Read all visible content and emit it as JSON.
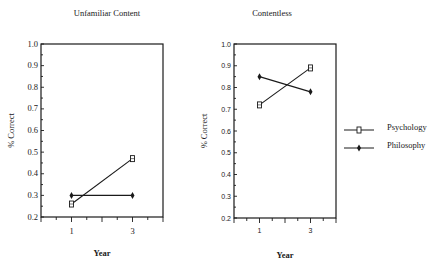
{
  "legend": {
    "items": [
      {
        "label": "Psychology",
        "marker": "open-square"
      },
      {
        "label": "Philosophy",
        "marker": "filled-diamond"
      }
    ]
  },
  "chart_data": [
    {
      "type": "line",
      "title": "Unfamiliar Content",
      "xlabel": "Year",
      "ylabel": "% Correct",
      "x": [
        1,
        3
      ],
      "x_tick_labels": [
        "1",
        "3"
      ],
      "y_tick_labels": [
        "0.2",
        "0.3",
        "0.4",
        "0.5",
        "0.6",
        "0.7",
        "0.8",
        "0.9",
        "1.0"
      ],
      "ylim": [
        0.2,
        1.0
      ],
      "xlim": [
        0,
        4
      ],
      "grid": false,
      "legend_position": "right",
      "series": [
        {
          "name": "Psychology",
          "values": [
            0.26,
            0.47
          ]
        },
        {
          "name": "Philosophy",
          "values": [
            0.3,
            0.3
          ]
        }
      ]
    },
    {
      "type": "line",
      "title": "Contentless",
      "xlabel": "Year",
      "ylabel": "% Correct",
      "x": [
        1,
        3
      ],
      "x_tick_labels": [
        "1",
        "3"
      ],
      "y_tick_labels": [
        "0.2",
        "0.3",
        "0.4",
        "0.5",
        "0.6",
        "0.7",
        "0.8",
        "0.9",
        "1.0"
      ],
      "ylim": [
        0.2,
        1.0
      ],
      "xlim": [
        0,
        4
      ],
      "grid": false,
      "legend_position": "right",
      "series": [
        {
          "name": "Psychology",
          "values": [
            0.72,
            0.89
          ]
        },
        {
          "name": "Philosophy",
          "values": [
            0.85,
            0.78
          ]
        }
      ]
    }
  ]
}
